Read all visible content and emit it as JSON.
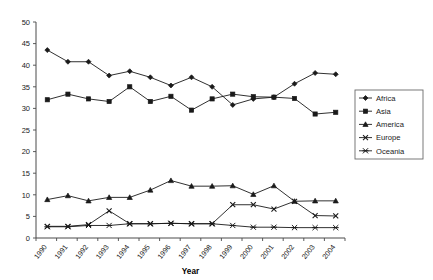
{
  "chart_data": {
    "type": "line",
    "title": "",
    "xlabel": "Year",
    "ylabel": "",
    "xlim": [
      1990,
      2004
    ],
    "ylim": [
      0,
      50
    ],
    "ytick_step": 5,
    "grid": false,
    "legend_position": "right",
    "categories": [
      "1990",
      "1991",
      "1992",
      "1993",
      "1994",
      "1995",
      "1996",
      "1997",
      "1998",
      "1999",
      "2000",
      "2001",
      "2002",
      "2003",
      "2004"
    ],
    "yticks": [
      "0",
      "5",
      "10",
      "15",
      "20",
      "25",
      "30",
      "35",
      "40",
      "45",
      "50"
    ],
    "series": [
      {
        "name": "Africa",
        "marker": "diamond",
        "values": [
          43.5,
          40.8,
          40.8,
          37.6,
          38.6,
          37.2,
          35.3,
          37.2,
          35.0,
          30.8,
          32.2,
          32.6,
          35.7,
          38.2,
          37.9
        ]
      },
      {
        "name": "Asia",
        "marker": "square",
        "values": [
          32.0,
          33.3,
          32.2,
          31.6,
          35.0,
          31.6,
          32.8,
          29.6,
          32.2,
          33.3,
          32.7,
          32.6,
          32.3,
          28.7,
          29.1
        ]
      },
      {
        "name": "America",
        "marker": "triangle",
        "values": [
          8.9,
          9.8,
          8.6,
          9.4,
          9.4,
          11.1,
          13.3,
          12.0,
          12.0,
          12.1,
          10.1,
          12.1,
          8.5,
          8.6,
          8.6
        ]
      },
      {
        "name": "Europe",
        "marker": "cross",
        "values": [
          2.7,
          2.7,
          3.1,
          6.3,
          3.3,
          3.3,
          3.4,
          3.3,
          3.3,
          7.7,
          7.7,
          6.7,
          8.5,
          5.2,
          5.1
        ]
      },
      {
        "name": "Oceania",
        "marker": "asterisk",
        "values": [
          2.6,
          2.6,
          2.9,
          2.9,
          3.3,
          3.3,
          3.4,
          3.3,
          3.3,
          2.9,
          2.5,
          2.5,
          2.4,
          2.4,
          2.4
        ]
      }
    ]
  },
  "legend": {
    "items": [
      {
        "label": "Africa"
      },
      {
        "label": "Asia"
      },
      {
        "label": "America"
      },
      {
        "label": "Europe"
      },
      {
        "label": "Oceania"
      }
    ]
  },
  "axis": {
    "x_title": "Year"
  }
}
